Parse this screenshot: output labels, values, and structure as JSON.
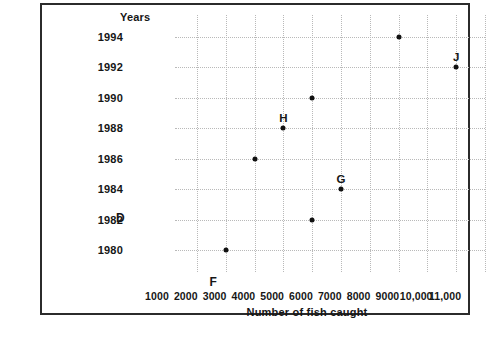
{
  "chart_data": {
    "type": "scatter",
    "title": "",
    "xlabel": "Number of fish caught",
    "ylabel": "Years",
    "xlim": [
      0,
      11500
    ],
    "ylim": [
      1979,
      1995
    ],
    "grid": true,
    "legend": "none",
    "xticks": [
      1000,
      2000,
      3000,
      4000,
      5000,
      6000,
      7000,
      8000,
      9000,
      10000,
      11000
    ],
    "xticklabels": [
      "1000",
      "2000",
      "3000",
      "4000",
      "5000",
      "6000",
      "7000",
      "8000",
      "9000",
      "10,000",
      "11,000"
    ],
    "yticks": [
      1980,
      1982,
      1984,
      1986,
      1988,
      1990,
      1992,
      1994
    ],
    "yticklabels": [
      "1980",
      "1982",
      "1984",
      "1986",
      "1988",
      "1990",
      "1992",
      "1994"
    ],
    "points": [
      {
        "x": 2000,
        "y": 1980,
        "label": ""
      },
      {
        "x": 5000,
        "y": 1982,
        "label": ""
      },
      {
        "x": 6000,
        "y": 1984,
        "label": "G"
      },
      {
        "x": 3000,
        "y": 1986,
        "label": ""
      },
      {
        "x": 4000,
        "y": 1988,
        "label": "H"
      },
      {
        "x": 5000,
        "y": 1990,
        "label": ""
      },
      {
        "x": 10000,
        "y": 1992,
        "label": "J"
      },
      {
        "x": 8000,
        "y": 1994,
        "label": ""
      }
    ],
    "annotations": [
      {
        "text": "D",
        "x": 1982,
        "axis": "y-label-suffix"
      },
      {
        "text": "F",
        "x": 3000,
        "axis": "below-x-axis"
      }
    ]
  }
}
